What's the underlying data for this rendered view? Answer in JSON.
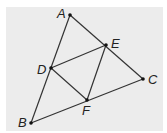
{
  "diagram": {
    "background": "#ececec",
    "line_color": "#333333",
    "points": {
      "A": {
        "x": 70,
        "y": 15,
        "label": "A",
        "lx": 57,
        "ly": 18
      },
      "B": {
        "x": 31,
        "y": 123,
        "label": "B",
        "lx": 18,
        "ly": 127
      },
      "C": {
        "x": 143,
        "y": 79,
        "label": "C",
        "lx": 148,
        "ly": 84
      },
      "D": {
        "x": 51,
        "y": 68,
        "label": "D",
        "lx": 37,
        "ly": 74
      },
      "E": {
        "x": 106,
        "y": 45,
        "label": "E",
        "lx": 111,
        "ly": 48
      },
      "F": {
        "x": 87,
        "y": 100,
        "label": "F",
        "lx": 82,
        "ly": 115
      }
    },
    "segments": [
      [
        "A",
        "B"
      ],
      [
        "A",
        "C"
      ],
      [
        "B",
        "C"
      ],
      [
        "D",
        "E"
      ],
      [
        "E",
        "F"
      ],
      [
        "D",
        "F"
      ]
    ]
  }
}
